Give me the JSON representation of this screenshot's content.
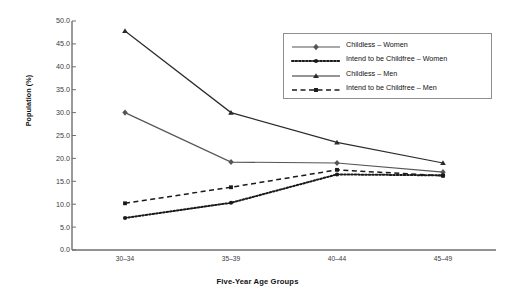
{
  "chart_data": {
    "type": "line",
    "title": "",
    "xlabel": "Five-Year Age Groups",
    "ylabel": "Population (%)",
    "categories": [
      "30–34",
      "35–39",
      "40–44",
      "45–49"
    ],
    "ylim": [
      0.0,
      50.0
    ],
    "yticks": [
      "0.0",
      "5.0",
      "10.0",
      "15.0",
      "20.0",
      "25.0",
      "30.0",
      "35.0",
      "40.0",
      "45.0",
      "50.0"
    ],
    "ytick_values": [
      0,
      5,
      10,
      15,
      20,
      25,
      30,
      35,
      40,
      45,
      50
    ],
    "grid": false,
    "legend_position": "upper-right-inside",
    "series": [
      {
        "name": "Childless – Women",
        "marker": "diamond",
        "linestyle": "solid",
        "color": "#555555",
        "values": [
          30.0,
          19.2,
          19.0,
          17.0
        ]
      },
      {
        "name": "Intend to be Childfree – Women",
        "marker": "circle",
        "linestyle": "dotted",
        "color": "#1a1a1a",
        "values": [
          7.0,
          10.3,
          16.5,
          16.3
        ]
      },
      {
        "name": "Childless – Men",
        "marker": "triangle",
        "linestyle": "solid",
        "color": "#2b2b2b",
        "values": [
          47.8,
          30.0,
          23.5,
          19.0
        ]
      },
      {
        "name": "Intend to be Childfree – Men",
        "marker": "square",
        "linestyle": "dashed",
        "color": "#1a1a1a",
        "values": [
          10.2,
          13.7,
          17.5,
          16.2
        ]
      }
    ]
  },
  "axis": {
    "y_title": "Population (%)",
    "x_title": "Five-Year Age Groups",
    "axis_color": "#6f6f6f"
  }
}
